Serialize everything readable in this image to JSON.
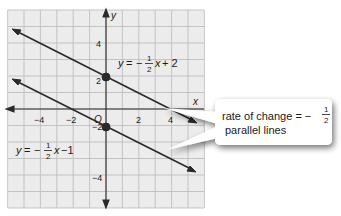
{
  "graph": {
    "x_axis_label": "x",
    "y_axis_label": "y",
    "origin_label": "O",
    "x_ticks": [
      "−4",
      "−2",
      "2",
      "4"
    ],
    "y_ticks": [
      "4",
      "2",
      "−2",
      "−4"
    ],
    "grid_range": {
      "xmin": -6,
      "xmax": 6,
      "ymin": -6,
      "ymax": 6
    },
    "grid_color": "#b9b9b9",
    "background_color": "#ececec",
    "line_color": "#2a2a2a"
  },
  "equations": {
    "line1": {
      "y": "y",
      "eq": "=",
      "minus": "−",
      "num": "1",
      "den": "2",
      "x": "x",
      "rest": "+ 2",
      "slope": -0.5,
      "intercept": 2
    },
    "line2": {
      "y": "y",
      "eq": "=",
      "minus": "−",
      "num": "1",
      "den": "2",
      "x": "x",
      "rest": "−1",
      "slope": -0.5,
      "intercept": -1
    }
  },
  "callout": {
    "line1_text": "rate of change = −",
    "frac_num": "1",
    "frac_den": "2",
    "line2_text": "parallel lines"
  }
}
